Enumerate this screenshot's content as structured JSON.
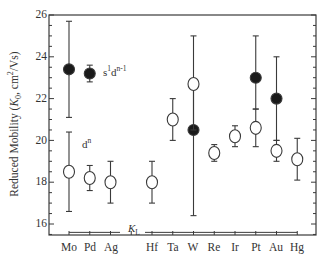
{
  "chart_data": {
    "type": "scatter",
    "title": "",
    "xlabel": "",
    "ylabel": "Reduced Mobility (K0, cm²/Vs)",
    "ylabel_parts": {
      "prefix": "Reduced Mobility (",
      "sym": "K",
      "sub": "0",
      "suffix": ", cm",
      "sup": "2",
      "end": "/Vs)"
    },
    "ylim": [
      15.5,
      26
    ],
    "yticks": [
      16,
      18,
      20,
      22,
      24,
      26
    ],
    "categories": [
      "Mo",
      "Pd",
      "Ag",
      "",
      "Hf",
      "Ta",
      "W",
      "Re",
      "Ir",
      "Pt",
      "Au",
      "Hg"
    ],
    "grid": false,
    "series": [
      {
        "name": "s1dn-1",
        "marker": "filled-circle",
        "points": [
          {
            "x": "Mo",
            "y": 23.4,
            "err_low": 21.1,
            "err_high": 25.7
          },
          {
            "x": "Pd",
            "y": 23.2,
            "err_low": 22.8,
            "err_high": 23.6
          },
          {
            "x": "W",
            "y": 20.5,
            "err_low": 16.4,
            "err_high": 22.7
          },
          {
            "x": "Pt",
            "y": 23.0,
            "err_low": 21.5,
            "err_high": 25.0
          },
          {
            "x": "Au",
            "y": 22.0,
            "err_low": 20.0,
            "err_high": 24.0
          }
        ]
      },
      {
        "name": "dn",
        "marker": "open-circle",
        "points": [
          {
            "x": "Mo",
            "y": 18.5,
            "err_low": 16.6,
            "err_high": 20.4
          },
          {
            "x": "Pd",
            "y": 18.2,
            "err_low": 17.6,
            "err_high": 18.8
          },
          {
            "x": "Ag",
            "y": 18.0,
            "err_low": 17.0,
            "err_high": 19.0
          },
          {
            "x": "Hf",
            "y": 18.0,
            "err_low": 17.0,
            "err_high": 19.0
          },
          {
            "x": "Ta",
            "y": 21.0,
            "err_low": 20.0,
            "err_high": 22.0
          },
          {
            "x": "W",
            "y": 22.7,
            "err_low": 20.5,
            "err_high": 25.0
          },
          {
            "x": "Re",
            "y": 19.4,
            "err_low": 19.0,
            "err_high": 19.8
          },
          {
            "x": "Ir",
            "y": 20.2,
            "err_low": 19.7,
            "err_high": 20.7
          },
          {
            "x": "Pt",
            "y": 20.6,
            "err_low": 19.7,
            "err_high": 21.5
          },
          {
            "x": "Au",
            "y": 19.5,
            "err_low": 19.0,
            "err_high": 20.0
          },
          {
            "x": "Hg",
            "y": 19.1,
            "err_low": 18.1,
            "err_high": 20.1
          }
        ]
      }
    ],
    "reference_line": {
      "label": "KL",
      "y": 15.6,
      "from": "Mo",
      "to": "Hg"
    },
    "annotations": [
      {
        "text": "s1dn-1",
        "near": "Pd",
        "y": 23.2
      },
      {
        "text": "dn",
        "near": "Mo/Pd",
        "y": 19.7
      },
      {
        "text": "KL",
        "near": "Hf",
        "y": 15.7
      }
    ]
  },
  "labels": {
    "ylabel_prefix": "Reduced Mobility (",
    "ylabel_K": "K",
    "ylabel_sub": "0",
    "ylabel_mid": ", cm",
    "ylabel_sup": "2",
    "ylabel_end": "/Vs)",
    "annot_s": "s",
    "annot_s_sup": "1",
    "annot_d": "d",
    "annot_d_sup": "n-1",
    "annot_dn": "d",
    "annot_dn_sup": "n",
    "annot_kl": "K",
    "annot_kl_sub": "L",
    "yticks": [
      "26",
      "24",
      "22",
      "20",
      "18",
      "16"
    ],
    "xticks": [
      "Mo",
      "Pd",
      "Ag",
      "Hf",
      "Ta",
      "W",
      "Re",
      "Ir",
      "Pt",
      "Au",
      "Hg"
    ]
  }
}
